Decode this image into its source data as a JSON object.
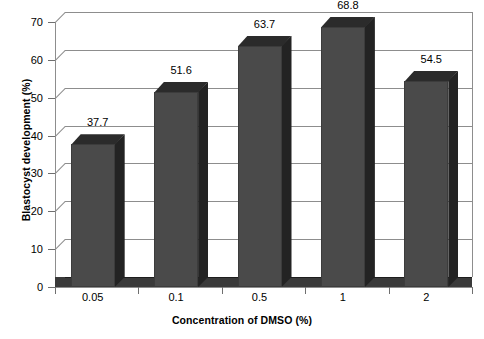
{
  "chart_data": {
    "type": "bar",
    "title": "",
    "subtitle": "",
    "xlabel": "Concentration of DMSO (%)",
    "ylabel": "Blastocyst development (%)",
    "categories": [
      "0.05",
      "0.1",
      "0.5",
      "1",
      "2"
    ],
    "values": [
      37.7,
      51.6,
      63.7,
      68.8,
      54.5
    ],
    "data_labels": [
      "37.7",
      "51.6",
      "63.7",
      "68.8",
      "54.5"
    ],
    "yticks": [
      "0",
      "10",
      "20",
      "30",
      "40",
      "50",
      "60",
      "70"
    ],
    "ytick_values": [
      0,
      10,
      20,
      30,
      40,
      50,
      60,
      70
    ],
    "ylim": [
      0,
      70
    ],
    "grid": true,
    "legend": false,
    "legend_position": "none",
    "style": "3d-column",
    "colors": {
      "bar_front": "#4a4a4a",
      "bar_side": "#232323",
      "bar_top": "#2b2b2b",
      "gridline": "#8d8d8d",
      "floor": "#3a3a3a",
      "background": "#ffffff",
      "text": "#000000"
    }
  }
}
